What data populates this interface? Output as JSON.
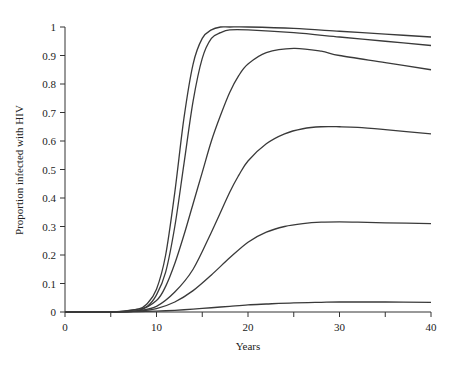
{
  "chart_data": {
    "type": "line",
    "title": "",
    "xlabel": "Years",
    "ylabel": "Proportion infected with HIV",
    "xlim": [
      0,
      40
    ],
    "ylim": [
      0,
      1
    ],
    "x_ticks": [
      0,
      5,
      10,
      15,
      20,
      25,
      30,
      35,
      40
    ],
    "x_tick_labels": [
      "0",
      "",
      "10",
      "",
      "20",
      "",
      "30",
      "",
      "40"
    ],
    "y_ticks": [
      0,
      0.1,
      0.2,
      0.3,
      0.4,
      0.5,
      0.6,
      0.7,
      0.8,
      0.9,
      1
    ],
    "y_tick_labels": [
      "0",
      "0.1",
      "0.2",
      "0.3",
      "0.4",
      "0.5",
      "0.6",
      "0.7",
      "0.8",
      "0.9",
      "1"
    ],
    "grid": false,
    "legend": null,
    "series": [
      {
        "name": "curve-1",
        "x": [
          0,
          5,
          8,
          9,
          10,
          11,
          12,
          13,
          14,
          15,
          16,
          17,
          18,
          20,
          25,
          30,
          35,
          40
        ],
        "values": [
          0,
          0,
          0.01,
          0.03,
          0.08,
          0.2,
          0.42,
          0.68,
          0.87,
          0.96,
          0.99,
          1.0,
          1.0,
          1.0,
          0.995,
          0.985,
          0.975,
          0.965
        ]
      },
      {
        "name": "curve-2",
        "x": [
          0,
          5,
          8,
          9,
          10,
          11,
          12,
          13,
          14,
          15,
          16,
          17,
          18,
          20,
          25,
          30,
          35,
          40
        ],
        "values": [
          0,
          0,
          0.01,
          0.02,
          0.06,
          0.14,
          0.3,
          0.52,
          0.74,
          0.89,
          0.96,
          0.98,
          0.99,
          0.99,
          0.98,
          0.965,
          0.95,
          0.935
        ]
      },
      {
        "name": "curve-3",
        "x": [
          0,
          5,
          8,
          10,
          11,
          12,
          13,
          14,
          15,
          16,
          17,
          18,
          19,
          20,
          22,
          25,
          28,
          30,
          35,
          40
        ],
        "values": [
          0,
          0,
          0.005,
          0.04,
          0.09,
          0.17,
          0.27,
          0.38,
          0.49,
          0.6,
          0.69,
          0.77,
          0.83,
          0.87,
          0.91,
          0.925,
          0.915,
          0.9,
          0.875,
          0.85
        ]
      },
      {
        "name": "curve-4",
        "x": [
          0,
          5,
          8,
          10,
          12,
          14,
          16,
          18,
          19,
          20,
          22,
          24,
          26,
          28,
          30,
          32,
          35,
          40
        ],
        "values": [
          0,
          0,
          0.005,
          0.02,
          0.07,
          0.15,
          0.28,
          0.42,
          0.48,
          0.53,
          0.59,
          0.625,
          0.643,
          0.65,
          0.65,
          0.648,
          0.64,
          0.625
        ]
      },
      {
        "name": "curve-5",
        "x": [
          0,
          5,
          8,
          10,
          12,
          14,
          16,
          18,
          20,
          22,
          24,
          26,
          28,
          30,
          32,
          35,
          40
        ],
        "values": [
          0,
          0,
          0.003,
          0.012,
          0.035,
          0.075,
          0.13,
          0.19,
          0.245,
          0.28,
          0.3,
          0.31,
          0.315,
          0.316,
          0.315,
          0.313,
          0.31
        ]
      },
      {
        "name": "curve-6",
        "x": [
          0,
          5,
          8,
          10,
          12,
          14,
          16,
          18,
          20,
          22,
          25,
          28,
          30,
          35,
          40
        ],
        "values": [
          0,
          0,
          0.001,
          0.003,
          0.006,
          0.01,
          0.015,
          0.02,
          0.025,
          0.028,
          0.032,
          0.034,
          0.035,
          0.035,
          0.034
        ]
      }
    ]
  }
}
